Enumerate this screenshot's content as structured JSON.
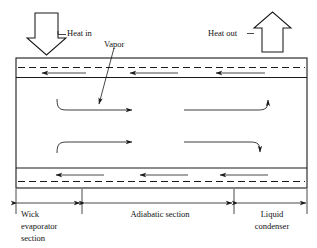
{
  "diagram": {
    "colors": {
      "line": "#1a1a1a",
      "text": "#111111",
      "background": "#ffffff"
    },
    "labels": {
      "heat_in": "Heat in",
      "heat_out": "Heat out",
      "vapor": "Vapor",
      "wick_evaporator_line1": "Wick",
      "wick_evaporator_line2": "evaporator",
      "wick_evaporator_line3": "section",
      "adiabatic_section": "Adiabatic section",
      "liquid_condenser_line1": "Liquid",
      "liquid_condenser_line2": "condenser"
    },
    "icons": {
      "heat_in_arrow": "block-arrow-down-icon",
      "heat_out_arrow": "block-arrow-up-icon",
      "vapor_leader": "leader-line-arrow-icon",
      "liquid_return_arrow": "arrow-left-icon",
      "vapor_flow_arrow": "curved-arrow-right-icon",
      "dimension_arrow": "double-headed-arrow-icon"
    },
    "sections": [
      {
        "name": "wick-evaporator-section",
        "x_start": 16,
        "x_end": 80
      },
      {
        "name": "adiabatic-section",
        "x_start": 86,
        "x_end": 231
      },
      {
        "name": "liquid-condenser-section",
        "x_start": 237,
        "x_end": 307
      }
    ],
    "liquid_return_arrows_top": [
      {
        "x_start": 86,
        "x_end": 44,
        "y": 73
      },
      {
        "x_start": 178,
        "x_end": 132,
        "y": 73
      },
      {
        "x_start": 265,
        "x_end": 218,
        "y": 73
      }
    ],
    "liquid_return_arrows_bottom": [
      {
        "x_start": 104,
        "x_end": 58,
        "y": 175
      },
      {
        "x_start": 188,
        "x_end": 142,
        "y": 175
      },
      {
        "x_start": 268,
        "x_end": 222,
        "y": 175
      }
    ],
    "vapor_flow_arrows": [
      {
        "name": "upper-left-vapor-arrow",
        "direction": "right"
      },
      {
        "name": "upper-right-vapor-arrow",
        "direction": "up-right"
      },
      {
        "name": "lower-left-vapor-arrow",
        "direction": "right"
      },
      {
        "name": "lower-right-vapor-arrow",
        "direction": "down-right"
      }
    ]
  }
}
